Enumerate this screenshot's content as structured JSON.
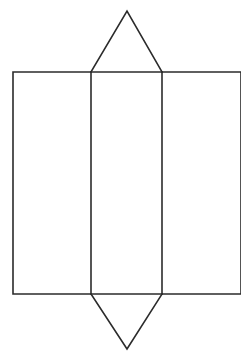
{
  "figure": {
    "title": "Net of a prism with triangular end flaps",
    "caption": "",
    "background_color": "#ffffff",
    "stroke_color": "#2b2b2b",
    "stroke_width": 1.6,
    "canvas": {
      "width": 241,
      "height": 359
    }
  },
  "geometry": {
    "description": "Line drawing net: three adjoining rectangular panels in a horizontal band, with an isosceles triangle flap pointing up above the middle panel and an isosceles triangle flap pointing down below the middle panel. The right panel is clipped by the right edge of the image.",
    "band": {
      "top_y": 72,
      "bottom_y": 294,
      "left_x": 13,
      "right_x": 241,
      "height": 222
    },
    "dividers_x": [
      91,
      162
    ],
    "panels": [
      {
        "name": "left-panel",
        "x1": 13,
        "x2": 91,
        "y1": 72,
        "y2": 294,
        "width": 78,
        "height": 222,
        "clipped": false
      },
      {
        "name": "middle-panel",
        "x1": 91,
        "x2": 162,
        "y1": 72,
        "y2": 294,
        "width": 71,
        "height": 222,
        "clipped": false
      },
      {
        "name": "right-panel",
        "x1": 162,
        "x2": 241,
        "y1": 72,
        "y2": 294,
        "width": 79,
        "height": 222,
        "clipped": true
      }
    ],
    "triangles": [
      {
        "name": "top-triangle-flap",
        "direction": "up",
        "apex": {
          "x": 127,
          "y": 11
        },
        "base_left": {
          "x": 91,
          "y": 72
        },
        "base_right": {
          "x": 162,
          "y": 72
        },
        "base_width": 71,
        "height": 61
      },
      {
        "name": "bottom-triangle-flap",
        "direction": "down",
        "apex": {
          "x": 127,
          "y": 349
        },
        "base_left": {
          "x": 91,
          "y": 294
        },
        "base_right": {
          "x": 162,
          "y": 294
        },
        "base_width": 71,
        "height": 55
      }
    ]
  },
  "chart_data": {
    "type": "line",
    "title": "Net of a prism with triangular end flaps",
    "xlabel": "",
    "ylabel": "",
    "xlim": [
      0,
      241
    ],
    "ylim": [
      359,
      0
    ],
    "grid": false,
    "legend": "none",
    "series": [
      {
        "name": "band-outline",
        "closed": false,
        "points": [
          [
            13,
            72
          ],
          [
            241,
            72
          ],
          [
            241,
            294
          ],
          [
            13,
            294
          ],
          [
            13,
            72
          ]
        ]
      },
      {
        "name": "divider-left",
        "closed": false,
        "points": [
          [
            91,
            72
          ],
          [
            91,
            294
          ]
        ]
      },
      {
        "name": "divider-right",
        "closed": false,
        "points": [
          [
            162,
            72
          ],
          [
            162,
            294
          ]
        ]
      },
      {
        "name": "top-triangle",
        "closed": false,
        "points": [
          [
            91,
            72
          ],
          [
            127,
            11
          ],
          [
            162,
            72
          ]
        ]
      },
      {
        "name": "bottom-triangle",
        "closed": false,
        "points": [
          [
            91,
            294
          ],
          [
            127,
            349
          ],
          [
            162,
            294
          ]
        ]
      }
    ]
  },
  "labels": {
    "vertex_labels": [],
    "edge_labels": [],
    "annotations": []
  }
}
